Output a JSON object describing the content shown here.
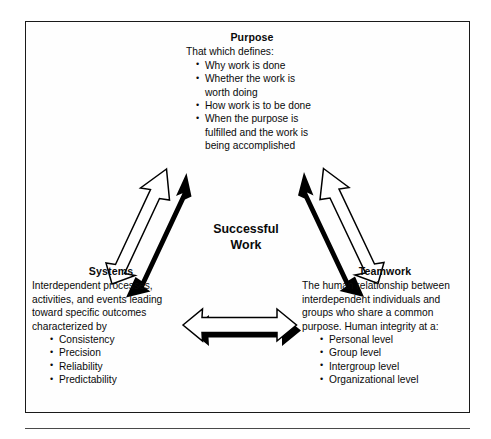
{
  "diagram": {
    "title": "Successful Work",
    "center_label_line1": "Successful",
    "center_label_line2": "Work",
    "nodes": {
      "purpose": {
        "heading": "Purpose",
        "lead": "That which defines:",
        "bullets": [
          "Why work is done",
          "Whether the work is worth doing",
          "How work is to be done",
          "When the purpose is fulfilled and the work is being accomplished"
        ]
      },
      "systems": {
        "heading": "Systems",
        "lead": "Interdependent processes, activities, and events leading toward specific outcomes characterized by",
        "bullets": [
          "Consistency",
          "Precision",
          "Reliability",
          "Predictability"
        ]
      },
      "teamwork": {
        "heading": "Teamwork",
        "lead": "The human relationship between interdependent individuals and groups who share a common purpose. Human integrity at a:",
        "bullets": [
          "Personal level",
          "Group level",
          "Intergroup level",
          "Organizational level"
        ]
      }
    },
    "connectors": [
      {
        "name": "purpose-systems-arrow",
        "style": "double-headed-3d-block-arrow"
      },
      {
        "name": "purpose-teamwork-arrow",
        "style": "double-headed-3d-block-arrow"
      },
      {
        "name": "systems-teamwork-arrow",
        "style": "double-headed-3d-block-arrow"
      }
    ],
    "colors": {
      "ink": "#0a0a0a",
      "frame": "#1a1a1a",
      "arrow_fill": "#ffffff",
      "arrow_stroke": "#000000",
      "arrow_shadow": "#000000",
      "background": "#ffffff"
    }
  }
}
